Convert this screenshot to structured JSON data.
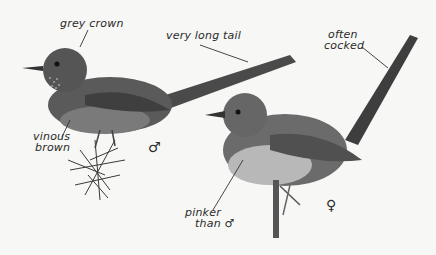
{
  "illustration": {
    "subject": "Dartford warbler, male and female",
    "annotations": [
      {
        "id": "grey-crown",
        "text": "grey crown"
      },
      {
        "id": "very-long-tail",
        "text": "very long tail"
      },
      {
        "id": "often-cocked-1",
        "text": "often"
      },
      {
        "id": "often-cocked-2",
        "text": "cocked"
      },
      {
        "id": "vinous-brown-1",
        "text": "vinous"
      },
      {
        "id": "vinous-brown-2",
        "text": "brown"
      },
      {
        "id": "pinker-1",
        "text": "pinker"
      },
      {
        "id": "pinker-2",
        "text": "than ♂"
      }
    ],
    "symbols": {
      "male": "♂",
      "female": "♀"
    }
  }
}
